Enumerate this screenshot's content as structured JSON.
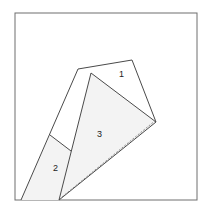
{
  "diagram": {
    "type": "folding-pattern",
    "colors": {
      "stroke": "#4a4a4a",
      "frame": "#6e6e6e",
      "shaded_fill": "#f3f3f3",
      "background": "#ffffff"
    },
    "frame": {
      "x": 15,
      "y": 13,
      "width": 182,
      "height": 187
    },
    "regions": [
      {
        "id": "1",
        "label": "1",
        "label_pos": [
          121,
          77
        ],
        "shaded": false
      },
      {
        "id": "2",
        "label": "2",
        "label_pos": [
          55,
          171
        ],
        "shaded": true
      },
      {
        "id": "3",
        "label": "3",
        "label_pos": [
          99,
          137
        ],
        "shaded": true
      }
    ],
    "fold_line": {
      "style": "dashed",
      "from": [
        61,
        198
      ],
      "to": [
        156,
        120
      ]
    }
  }
}
